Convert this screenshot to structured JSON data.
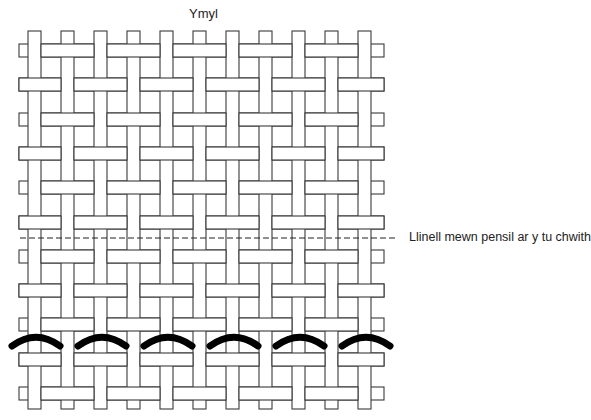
{
  "diagram": {
    "title": "Ymyl",
    "pencil_line_label": "Llinell mewn pensil ar y tu chwith",
    "weave": {
      "type": "plain",
      "warp_count": 11,
      "weft_count": 11,
      "warp_x0": 28,
      "warp_spacing": 33,
      "strip_width": 13,
      "weft_y0": 44,
      "weft_spacing": 34.3,
      "warp_top": 31,
      "warp_bottom": 409,
      "weft_left": 19,
      "weft_right": 384
    },
    "pencil_line": {
      "x1": 20,
      "x2": 397,
      "y": 238
    },
    "stitches": {
      "count": 6,
      "center_x0": 36,
      "spacing": 66,
      "half_width": 24,
      "y_end": 346,
      "y_peak": 337
    }
  }
}
